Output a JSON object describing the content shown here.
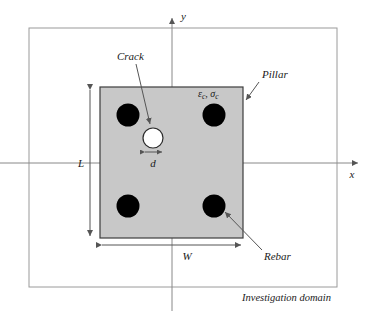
{
  "figure": {
    "background_color": "#ffffff"
  },
  "colors": {
    "pillar_fill": "#c8c8c8",
    "pillar_stroke": "#3c3c3c",
    "rebar_fill": "#000000",
    "crack_fill": "#ffffff",
    "crack_stroke": "#2b2b2b",
    "axis_stroke": "#888888",
    "domain_stroke": "#9a9a9a",
    "leader_stroke": "#555555",
    "dimension_stroke": "#555555",
    "text_color": "#1a1a1a"
  },
  "axes": {
    "x_label": "x",
    "y_label": "y",
    "origin": {
      "x": 172,
      "y": 163
    },
    "x_axis": {
      "x1": 0,
      "x2": 362,
      "y": 163
    },
    "y_axis": {
      "x": 172,
      "y1": 310,
      "y2": 14
    }
  },
  "domain": {
    "label": "Investigation domain",
    "rect": {
      "x": 29,
      "y": 28,
      "width": 308,
      "height": 259
    },
    "label_position": {
      "x": 331,
      "y": 300
    }
  },
  "pillar": {
    "label": "Pillar",
    "rect": {
      "x": 100,
      "y": 87,
      "width": 143,
      "height": 151
    },
    "label_position": {
      "x": 262,
      "y": 77
    },
    "leader": {
      "x1": 258,
      "y1": 82,
      "x2": 245,
      "y2": 101
    }
  },
  "material": {
    "label": "εc, σc",
    "strain_symbol": "ε",
    "stress_symbol": "σ",
    "subscript": "c",
    "position": {
      "x": 198,
      "y": 97
    }
  },
  "crack": {
    "label": "Crack",
    "circle": {
      "cx": 153,
      "cy": 138,
      "r": 10
    },
    "label_position": {
      "x": 117,
      "y": 60
    },
    "leader": {
      "x1": 136,
      "y1": 64,
      "x2": 151,
      "y2": 125
    }
  },
  "rebars": {
    "label": "Rebar",
    "radius": 11.5,
    "positions": [
      {
        "name": "rebar-top-left",
        "cx": 128,
        "cy": 115
      },
      {
        "name": "rebar-top-right",
        "cx": 214,
        "cy": 115
      },
      {
        "name": "rebar-bottom-left",
        "cx": 128,
        "cy": 206
      },
      {
        "name": "rebar-bottom-right",
        "cx": 214,
        "cy": 206
      }
    ],
    "label_position": {
      "x": 264,
      "y": 258
    },
    "leader": {
      "x1": 261,
      "y1": 250,
      "x2": 224,
      "y2": 211
    }
  },
  "dimensions": [
    {
      "name": "length",
      "label": "L",
      "orientation": "vertical",
      "line": {
        "x": 90,
        "y1": 88,
        "y2": 238
      },
      "label_position": {
        "x": 81,
        "y": 166
      }
    },
    {
      "name": "width",
      "label": "W",
      "orientation": "horizontal",
      "line": {
        "y": 245,
        "x1": 100,
        "x2": 243
      },
      "label_position": {
        "x": 187,
        "y": 259
      }
    },
    {
      "name": "crack-diameter",
      "label": "d",
      "orientation": "horizontal",
      "line": {
        "y": 152,
        "x1": 144,
        "x2": 163
      },
      "label_position": {
        "x": 153,
        "y": 166
      }
    }
  ]
}
